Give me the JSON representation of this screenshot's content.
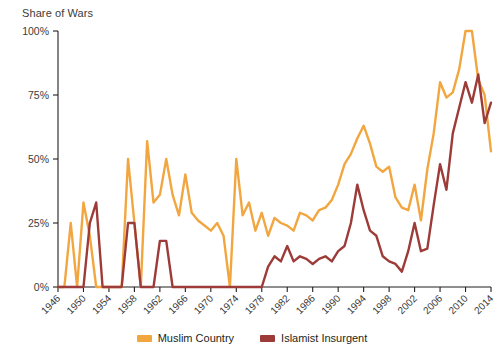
{
  "chart_data": {
    "type": "line",
    "title": "Share of Wars",
    "xlabel": "",
    "ylabel": "Share of Wars",
    "ylim": [
      0,
      100
    ],
    "xlim": [
      1946,
      2014
    ],
    "grid": false,
    "legend_position": "bottom-center",
    "y_ticks": [
      "0%",
      "25%",
      "50%",
      "75%",
      "100%"
    ],
    "y_tick_values": [
      0,
      25,
      50,
      75,
      100
    ],
    "x_ticks": [
      "1946",
      "1950",
      "1954",
      "1958",
      "1962",
      "1966",
      "1970",
      "1974",
      "1978",
      "1982",
      "1986",
      "1990",
      "1994",
      "1998",
      "2002",
      "2006",
      "2010",
      "2014"
    ],
    "x_tick_values": [
      1946,
      1950,
      1954,
      1958,
      1962,
      1966,
      1970,
      1974,
      1978,
      1982,
      1986,
      1990,
      1994,
      1998,
      2002,
      2006,
      2010,
      2014
    ],
    "x": [
      1946,
      1947,
      1948,
      1949,
      1950,
      1951,
      1952,
      1953,
      1954,
      1955,
      1956,
      1957,
      1958,
      1959,
      1960,
      1961,
      1962,
      1963,
      1964,
      1965,
      1966,
      1967,
      1968,
      1969,
      1970,
      1971,
      1972,
      1973,
      1974,
      1975,
      1976,
      1977,
      1978,
      1979,
      1980,
      1981,
      1982,
      1983,
      1984,
      1985,
      1986,
      1987,
      1988,
      1989,
      1990,
      1991,
      1992,
      1993,
      1994,
      1995,
      1996,
      1997,
      1998,
      1999,
      2000,
      2001,
      2002,
      2003,
      2004,
      2005,
      2006,
      2007,
      2008,
      2009,
      2010,
      2011,
      2012,
      2013,
      2014
    ],
    "series": [
      {
        "name": "Muslim Country",
        "color": "#F2A640",
        "values": [
          0,
          0,
          25,
          0,
          33,
          20,
          0,
          0,
          0,
          0,
          0,
          50,
          25,
          0,
          57,
          33,
          36,
          50,
          36,
          28,
          44,
          29,
          26,
          24,
          22,
          25,
          20,
          0,
          50,
          28,
          33,
          22,
          29,
          20,
          27,
          25,
          24,
          22,
          29,
          28,
          26,
          30,
          31,
          34,
          40,
          48,
          52,
          58,
          63,
          56,
          47,
          45,
          47,
          35,
          31,
          30,
          40,
          26,
          46,
          60,
          80,
          74,
          76,
          85,
          100,
          100,
          81,
          75,
          53
        ]
      },
      {
        "name": "Islamist Insurgent",
        "color": "#9D3B38",
        "values": [
          0,
          0,
          0,
          0,
          0,
          25,
          33,
          0,
          0,
          0,
          0,
          25,
          25,
          0,
          0,
          0,
          18,
          18,
          0,
          0,
          0,
          0,
          0,
          0,
          0,
          0,
          0,
          0,
          0,
          0,
          0,
          0,
          0,
          8,
          12,
          10,
          16,
          10,
          12,
          11,
          9,
          11,
          12,
          10,
          14,
          16,
          25,
          40,
          30,
          22,
          20,
          12,
          10,
          9,
          6,
          14,
          25,
          14,
          15,
          32,
          48,
          38,
          60,
          70,
          80,
          72,
          83,
          64,
          72
        ]
      }
    ]
  },
  "legend": {
    "items": [
      {
        "label": "Muslim Country",
        "color": "#F2A640"
      },
      {
        "label": "Islamist Insurgent",
        "color": "#9D3B38"
      }
    ]
  }
}
